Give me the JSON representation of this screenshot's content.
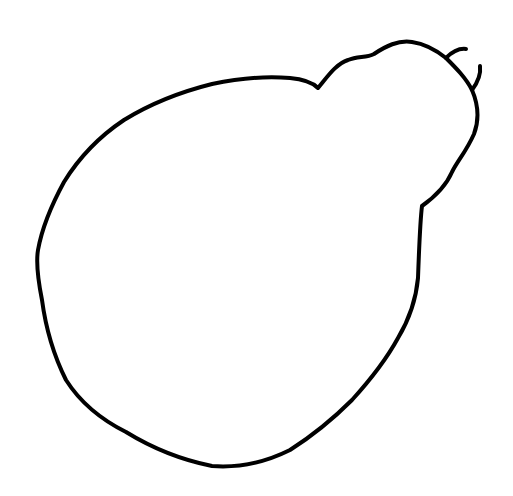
{
  "drawing": {
    "subject": "pear-shaped outline sketch",
    "background_color": "#ffffff",
    "stroke_color": "#000000",
    "stroke_width": 4,
    "body_path": "M318,88 C328,76 336,64 348,60 C358,56 366,58 374,54 C386,46 398,40 412,42 C426,44 436,50 446,58 C456,68 466,78 472,90 C478,104 480,118 474,134 C466,152 458,160 452,172 C446,186 436,196 422,206 C420,222 419,250 418,278 C416,300 410,318 398,338 C386,360 372,378 352,400 C332,420 312,436 290,450 C262,464 238,468 212,466 C182,460 152,448 126,432 C98,418 80,402 66,380 C54,356 46,330 42,300 C38,280 36,262 38,250 C42,228 52,204 64,182 C80,156 100,136 124,120 C150,104 180,92 212,84 C240,78 266,76 290,78 C302,79 312,82 318,88 Z",
    "antennae": [
      "M446,58 C452,52 458,48 466,49",
      "M472,90 C478,82 481,74 480,66"
    ]
  }
}
